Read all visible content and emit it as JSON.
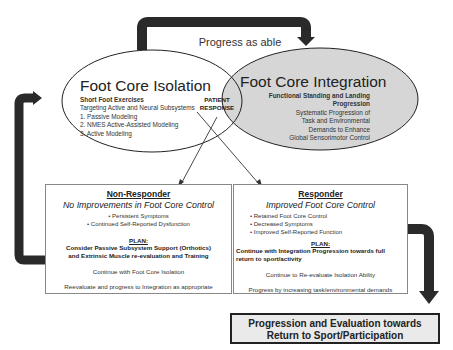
{
  "diagram": {
    "top_arrow_label": "Progress as able",
    "isolation": {
      "title": "Foot Core Isolation",
      "subtitle": "Short Foot Exercises",
      "lines": [
        "Targeting Active and Neural Subsystems",
        "1. Passive Modeling",
        "2. NMES Active-Assisted Modeling",
        "3. Active Modeling"
      ]
    },
    "integration": {
      "title": "Foot Core Integration",
      "subtitle_line1": "Functional Standing and Landing",
      "subtitle_line2": "Progression",
      "lines": [
        "Systematic Progression of",
        "Task and Environmental",
        "Demands to Enhance",
        "Global Sensorimotor Control"
      ]
    },
    "patient_response": {
      "line1": "PATIENT",
      "line2": "RESPONSE"
    },
    "non_responder": {
      "heading": "Non-Responder",
      "status": "No Improvements in Foot Core Control",
      "bullets": [
        "Persistent Symptoms",
        "Continued Self-Reported Dysfunction"
      ],
      "plan_label": "PLAN:",
      "plan_line1": "Consider Passive Subsystem Support (Orthotics)",
      "plan_line2": "and Extrinsic Muscle re-evaluation and Training",
      "note1": "Continue with Foot Core Isolation",
      "note2": "Reevaluate and progress to Integration as appropriate"
    },
    "responder": {
      "heading": "Responder",
      "status": "Improved Foot Core Control",
      "bullets": [
        "Retained Foot Core Control",
        "Decreased Symptoms",
        "Improved Self-Reported Function"
      ],
      "plan_label": "PLAN:",
      "plan_line1": "Continue with Integration Progression towards full",
      "plan_line2": "return to sport/activity",
      "note1": "Continue to Re-evaluate Isolation Ability",
      "note2": "Progress by increasing  task/environmental demands"
    },
    "final": {
      "line1": "Progression and Evaluation towards",
      "line2": "Return to Sport/Participation"
    }
  }
}
